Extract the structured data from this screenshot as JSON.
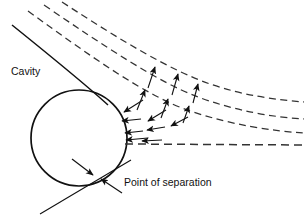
{
  "figure": {
    "width": 306,
    "height": 218,
    "background_color": "#ffffff",
    "line_color": "#111111",
    "dash_color": "#333333"
  },
  "labels": {
    "cavity": "Cavity",
    "point_of_separation": "Point of separation"
  },
  "body": {
    "shape": "circle",
    "name": "cylinder",
    "center_x": 79,
    "center_y": 138,
    "radius": 48,
    "stroke_width": 1.6
  },
  "streamlines": [
    {
      "name": "streamline-outer-1",
      "style": "dashed",
      "path": "M 62 2 C 120 40, 170 70, 210 84 C 245 96, 278 100, 304 102"
    },
    {
      "name": "streamline-outer-2",
      "style": "dashed",
      "path": "M 44 5 C 104 46, 158 82, 198 97 C 236 111, 272 117, 304 119"
    },
    {
      "name": "streamline-outer-3",
      "style": "dashed",
      "path": "M 28 11 C 90 56, 146 96, 190 111 C 232 125, 272 131, 304 133"
    },
    {
      "name": "streamline-separating",
      "style": "solid-to-dashed",
      "solid_path": "M 12 25 C 50 55, 85 82, 107 104",
      "dashed_path": "M 124 144 L 304 145"
    }
  ],
  "velocity_arrows": {
    "name": "velocity-vectors",
    "count": 14,
    "description": "Filled harpoon-style arrows showing reversed and upward flow in the separated wake",
    "items": [
      {
        "x1": 148,
        "y1": 88,
        "x2": 155,
        "y2": 67,
        "name": "velocity-arrow-up-1"
      },
      {
        "x1": 172,
        "y1": 95,
        "x2": 178,
        "y2": 74,
        "name": "velocity-arrow-up-2"
      },
      {
        "x1": 193,
        "y1": 103,
        "x2": 198,
        "y2": 84,
        "name": "velocity-arrow-up-3"
      },
      {
        "x1": 137,
        "y1": 110,
        "x2": 145,
        "y2": 90,
        "name": "velocity-arrow-up-4"
      },
      {
        "x1": 161,
        "y1": 118,
        "x2": 168,
        "y2": 99,
        "name": "velocity-arrow-up-5"
      },
      {
        "x1": 183,
        "y1": 123,
        "x2": 189,
        "y2": 106,
        "name": "velocity-arrow-up-6"
      },
      {
        "x1": 143,
        "y1": 100,
        "x2": 125,
        "y2": 112,
        "name": "velocity-arrow-diag-1"
      },
      {
        "x1": 166,
        "y1": 110,
        "x2": 149,
        "y2": 121,
        "name": "velocity-arrow-diag-2"
      },
      {
        "x1": 188,
        "y1": 117,
        "x2": 172,
        "y2": 126,
        "name": "velocity-arrow-diag-3"
      },
      {
        "x1": 141,
        "y1": 119,
        "x2": 123,
        "y2": 121,
        "name": "velocity-arrow-left-1"
      },
      {
        "x1": 165,
        "y1": 127,
        "x2": 148,
        "y2": 130,
        "name": "velocity-arrow-left-2"
      },
      {
        "x1": 142,
        "y1": 131,
        "x2": 126,
        "y2": 133,
        "name": "velocity-arrow-left-3"
      },
      {
        "x1": 147,
        "y1": 137,
        "x2": 127,
        "y2": 139,
        "name": "velocity-arrow-left-4"
      },
      {
        "x1": 160,
        "y1": 139,
        "x2": 141,
        "y2": 140,
        "name": "velocity-arrow-left-5"
      }
    ]
  },
  "annotations": {
    "cavity_label": {
      "x": 11,
      "y": 75
    },
    "separation_label": {
      "x": 124,
      "y": 186
    },
    "separation_point": {
      "x": 96,
      "y": 177
    },
    "pointer_arrows": [
      {
        "x1": 73,
        "y1": 160,
        "x2": 93,
        "y2": 175,
        "name": "separation-pointer-upper"
      },
      {
        "x1": 121,
        "y1": 192,
        "x2": 100,
        "y2": 179,
        "name": "separation-pointer-lower"
      }
    ],
    "tangent_line": {
      "name": "separation-tangent-line",
      "path": "M 40 214 L 131 160"
    }
  }
}
